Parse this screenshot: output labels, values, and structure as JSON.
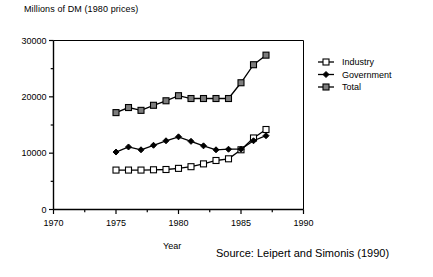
{
  "chart_data": {
    "type": "line",
    "title": "",
    "ylabel": "Millions of DM (1980 prices)",
    "xlabel": "Year",
    "source": "Source: Leipert and Simonis (1990)",
    "xlim": [
      1970,
      1990
    ],
    "ylim": [
      0,
      30000
    ],
    "xticks": [
      1970,
      1975,
      1980,
      1985,
      1990
    ],
    "xminor_step": 2.5,
    "yticks": [
      0,
      10000,
      20000,
      30000
    ],
    "yminor_step": 5000,
    "grid": false,
    "legend_position": "right",
    "x": [
      1975,
      1976,
      1977,
      1978,
      1979,
      1980,
      1981,
      1982,
      1983,
      1984,
      1985,
      1986,
      1987
    ],
    "series": [
      {
        "name": "Industry",
        "marker": "open-square",
        "values": [
          7000,
          7000,
          7000,
          7050,
          7100,
          7300,
          7600,
          8100,
          8700,
          9000,
          10600,
          12700,
          14200
        ]
      },
      {
        "name": "Government",
        "marker": "filled-diamond",
        "values": [
          10200,
          11100,
          10600,
          11400,
          12200,
          12900,
          12100,
          11300,
          10600,
          10700,
          10700,
          12200,
          13100
        ]
      },
      {
        "name": "Total",
        "marker": "filled-square",
        "values": [
          17200,
          18100,
          17600,
          18500,
          19300,
          20200,
          19700,
          19700,
          19700,
          19700,
          22500,
          25700,
          27400
        ]
      }
    ]
  },
  "legend": {
    "items": [
      {
        "label": "Industry"
      },
      {
        "label": "Government"
      },
      {
        "label": "Total"
      }
    ]
  },
  "colors": {
    "line": "#000000",
    "axis": "#000000",
    "marker_fill_open": "#ffffff",
    "marker_fill_solid": "#7d7d7d"
  }
}
